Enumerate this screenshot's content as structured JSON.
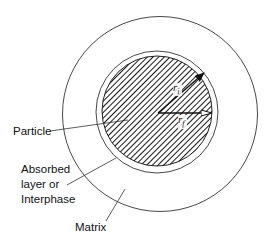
{
  "diagram": {
    "type": "concentric-circles-cross-section",
    "colors": {
      "stroke": "#222222",
      "hatch": "#1a1a1a",
      "background": "#ffffff"
    },
    "regions": [
      {
        "id": "particle",
        "label": "Particle",
        "fill": "diagonal-hatch"
      },
      {
        "id": "interphase",
        "label_lines": [
          "Absorbed",
          "layer or",
          "Interphase"
        ],
        "fill": "none"
      },
      {
        "id": "matrix",
        "label": "Matrix",
        "fill": "none"
      }
    ],
    "radii_labels": {
      "interphase_radius": "r",
      "interphase_radius_sub": "i",
      "particle_radius": "r",
      "particle_radius_sub": "f"
    }
  },
  "labels": {
    "particle": "Particle",
    "interphase_line1": "Absorbed",
    "interphase_line2": "layer or",
    "interphase_line3": "Interphase",
    "matrix": "Matrix"
  }
}
